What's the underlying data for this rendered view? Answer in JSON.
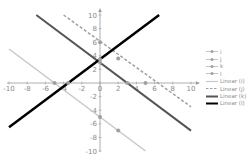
{
  "chart_data": {
    "type": "scatter",
    "title": "",
    "xlabel": "",
    "ylabel": "",
    "xlim": [
      -10,
      10
    ],
    "ylim": [
      -10,
      10
    ],
    "x_ticks": [
      "-10",
      "-8",
      "-6",
      "-4",
      "-2",
      "0",
      "2",
      "4",
      "6",
      "8",
      "10"
    ],
    "y_ticks": [
      "10",
      "8",
      "6",
      "4",
      "2",
      "0",
      "-2",
      "-4",
      "-6",
      "-8",
      "-10"
    ],
    "grid": false,
    "legend_position": "right",
    "series": [
      {
        "name": "i",
        "points": [
          [
            -5,
            0
          ],
          [
            0,
            -5
          ],
          [
            2,
            -7
          ]
        ],
        "color": "#c8c8c8",
        "marker": "circle"
      },
      {
        "name": "j",
        "points": [
          [
            0,
            6
          ],
          [
            2,
            3.6
          ],
          [
            5,
            0
          ]
        ],
        "color": "#a0a0a0",
        "marker": "circle"
      },
      {
        "name": "k",
        "points": [
          [
            0,
            3
          ],
          [
            3,
            0
          ]
        ],
        "color": "#555555",
        "marker": "triangle"
      },
      {
        "name": "l",
        "points": [
          [
            -3.5,
            0
          ],
          [
            0,
            3.5
          ]
        ],
        "color": "#000000",
        "marker": "dash"
      }
    ],
    "trendlines": [
      {
        "name": "Linear (i)",
        "from": [
          -10,
          5
        ],
        "to": [
          5,
          -10
        ],
        "color": "#c8c8c8",
        "style": "solid",
        "width": 1.5
      },
      {
        "name": "Linear (j)",
        "from": [
          -4,
          10
        ],
        "to": [
          10,
          -3.5
        ],
        "color": "#a0a0a0",
        "style": "dashed",
        "width": 1.5
      },
      {
        "name": "Linear (k)",
        "from": [
          -7,
          10
        ],
        "to": [
          10,
          -7
        ],
        "color": "#555555",
        "style": "solid",
        "width": 2
      },
      {
        "name": "Linear (l)",
        "from": [
          -10,
          -6.5
        ],
        "to": [
          6.5,
          10
        ],
        "color": "#000000",
        "style": "solid",
        "width": 2.5
      }
    ]
  },
  "legend": {
    "items": [
      {
        "label": "i",
        "type": "marker",
        "color": "#a0a0a0"
      },
      {
        "label": "j",
        "type": "marker",
        "color": "#a0a0a0"
      },
      {
        "label": "k",
        "type": "marker",
        "color": "#a0a0a0"
      },
      {
        "label": "l",
        "type": "marker",
        "color": "#a0a0a0"
      },
      {
        "label": "Linear (i)",
        "type": "line",
        "color": "#c8c8c8",
        "style": "solid"
      },
      {
        "label": "Linear (j)",
        "type": "line",
        "color": "#a0a0a0",
        "style": "dashed"
      },
      {
        "label": "Linear (k)",
        "type": "line",
        "color": "#555555",
        "style": "solid"
      },
      {
        "label": "Linear (l)",
        "type": "line",
        "color": "#000000",
        "style": "solid"
      }
    ]
  }
}
